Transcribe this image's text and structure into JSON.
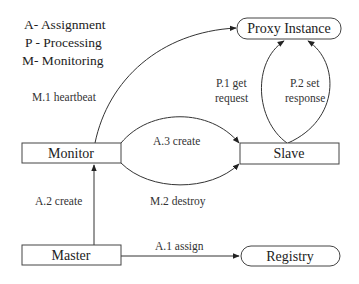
{
  "legend": [
    {
      "text": "A- Assignment"
    },
    {
      "text": "P - Processing"
    },
    {
      "text": "M- Monitoring"
    }
  ],
  "nodes": {
    "proxy": {
      "label": "Proxy Instance",
      "shape": "rounded"
    },
    "monitor": {
      "label": "Monitor",
      "shape": "rectangle"
    },
    "slave": {
      "label": "Slave",
      "shape": "rectangle"
    },
    "master": {
      "label": "Master",
      "shape": "rectangle"
    },
    "registry": {
      "label": "Registry",
      "shape": "rounded"
    }
  },
  "edges": {
    "m1": {
      "label": "M.1 heartbeat",
      "from": "Monitor",
      "to": "Proxy Instance"
    },
    "a3": {
      "label": "A.3 create",
      "from": "Monitor",
      "to": "Slave"
    },
    "m2": {
      "label": "M.2 destroy",
      "from": "Monitor",
      "to": "Slave"
    },
    "a2": {
      "label": "A.2 create",
      "from": "Master",
      "to": "Monitor"
    },
    "a1": {
      "label": "A.1 assign",
      "from": "Master",
      "to": "Registry"
    },
    "p1": {
      "label_line1": "P.1 get",
      "label_line2": "request",
      "from": "Slave",
      "to": "Proxy Instance"
    },
    "p2": {
      "label_line1": "P.2 set",
      "label_line2": "response",
      "from": "Slave",
      "to": "Proxy Instance"
    }
  },
  "colors": {
    "stroke": "#333333",
    "text": "#222222",
    "background": "#ffffff"
  }
}
